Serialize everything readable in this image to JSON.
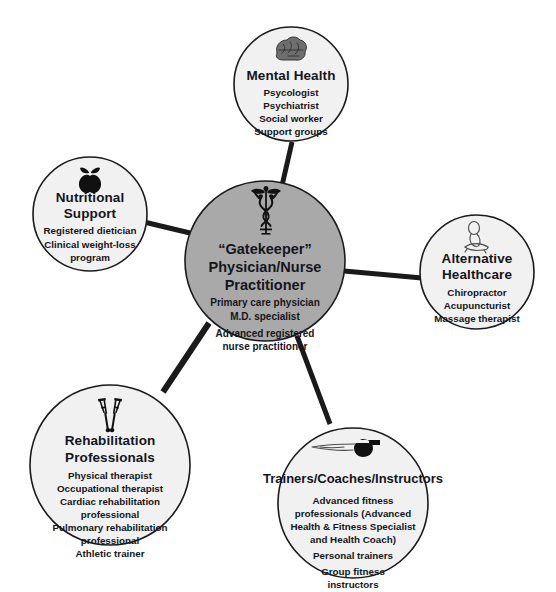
{
  "diagram": {
    "colors": {
      "center_fill": "#a9a9a9",
      "node_fill": "#f1f1f1",
      "outline": "#1a1a1a",
      "text": "#15151c",
      "background": "#ffffff"
    },
    "center": {
      "id": "gatekeeper",
      "icon": "caduceus-icon",
      "title_lines": [
        "“Gatekeeper”",
        "Physician/Nurse",
        "Practitioner"
      ],
      "items": [
        "Primary care physician",
        "M.D. specialist",
        "",
        "Advanced registered",
        "nurse practitioner"
      ]
    },
    "nodes": [
      {
        "id": "mental-health",
        "icon": "brain-icon",
        "title_lines": [
          "Mental Health"
        ],
        "items": [
          "Psycologist",
          "Psychiatrist",
          "Social worker",
          "Support groups"
        ]
      },
      {
        "id": "nutritional-support",
        "icon": "apple-icon",
        "title_lines": [
          "Nutritional",
          "Support"
        ],
        "items": [
          "Registered dietician",
          "Clinical weight-loss",
          "program"
        ]
      },
      {
        "id": "alternative-healthcare",
        "icon": "massage-icon",
        "title_lines": [
          "Alternative",
          "Healthcare"
        ],
        "items": [
          "Chiropractor",
          "Acupuncturist",
          "Massage therapist"
        ]
      },
      {
        "id": "rehabilitation-professionals",
        "icon": "crutches-icon",
        "title_lines": [
          "Rehabilitation",
          "Professionals"
        ],
        "items": [
          "Physical therapist",
          "Occupational therapist",
          "Cardiac rehabilitation",
          "professional",
          "Pulmonary rehabilitation",
          "professional",
          "Athletic trainer"
        ]
      },
      {
        "id": "trainers-coaches-instructors",
        "icon": "whistle-icon",
        "title_lines": [
          "Trainers/Coaches/Instructors"
        ],
        "items": [
          "Advanced fitness",
          "professionals (Advanced",
          "Health & Fitness Specialist",
          "and Health Coach)",
          "",
          "Personal trainers",
          "",
          "Group fitness",
          "instructors"
        ]
      }
    ],
    "connectors": [
      {
        "id": "center-to-mental-health"
      },
      {
        "id": "center-to-nutritional-support"
      },
      {
        "id": "center-to-alternative-healthcare"
      },
      {
        "id": "center-to-rehabilitation-professionals"
      },
      {
        "id": "center-to-trainers-coaches-instructors"
      }
    ]
  }
}
